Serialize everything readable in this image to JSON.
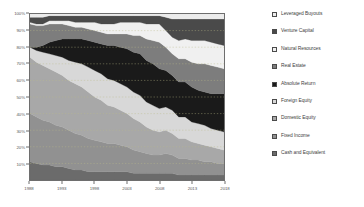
{
  "chart_data": {
    "type": "area",
    "title": "",
    "xlabel": "",
    "ylabel": "",
    "stacked": true,
    "stack_normalized": true,
    "grid": true,
    "grid_style": "dotted-horizontal",
    "legend_position": "right",
    "xlim": [
      1988,
      2018
    ],
    "ylim": [
      0,
      100
    ],
    "yticks": [
      "10%",
      "20%",
      "30%",
      "40%",
      "50%",
      "60%",
      "70%",
      "80%",
      "90%",
      "100%"
    ],
    "ytick_values": [
      10,
      20,
      30,
      40,
      50,
      60,
      70,
      80,
      90,
      100
    ],
    "xticks": [
      "1988",
      "1993",
      "1998",
      "2003",
      "2008",
      "2013",
      "2018"
    ],
    "xtick_values": [
      1988,
      1993,
      1998,
      2003,
      2008,
      2013,
      2018
    ],
    "x": [
      1988,
      1989,
      1990,
      1991,
      1992,
      1993,
      1994,
      1995,
      1996,
      1997,
      1998,
      1999,
      2000,
      2001,
      2002,
      2003,
      2004,
      2005,
      2006,
      2007,
      2008,
      2009,
      2010,
      2011,
      2012,
      2013,
      2014,
      2015,
      2016,
      2017,
      2018
    ],
    "series": [
      {
        "name": "Cash and Equivalent",
        "color": "#6b6b6b",
        "values": [
          11,
          10,
          9,
          9,
          8,
          8,
          7,
          6,
          6,
          5,
          5,
          5,
          5,
          5,
          5,
          5,
          4,
          4,
          4,
          4,
          4,
          4,
          4,
          3,
          3,
          3,
          3,
          3,
          3,
          3,
          3
        ]
      },
      {
        "name": "Fixed Income",
        "color": "#919191",
        "values": [
          29,
          28,
          27,
          26,
          25,
          24,
          23,
          22,
          21,
          20,
          19,
          18,
          17,
          17,
          16,
          15,
          14,
          13,
          12,
          11,
          11,
          12,
          11,
          10,
          10,
          9,
          9,
          8,
          8,
          7,
          7
        ]
      },
      {
        "name": "Domestic Equity",
        "color": "#a8a8a8",
        "values": [
          34,
          33,
          33,
          32,
          32,
          31,
          30,
          30,
          29,
          28,
          26,
          25,
          23,
          22,
          21,
          20,
          19,
          18,
          16,
          15,
          14,
          14,
          13,
          12,
          12,
          11,
          10,
          10,
          9,
          9,
          8
        ]
      },
      {
        "name": "Foreign Equity",
        "color": "#d8d8d8",
        "values": [
          6,
          7,
          8,
          9,
          10,
          11,
          12,
          13,
          14,
          15,
          16,
          16,
          16,
          16,
          16,
          16,
          16,
          16,
          15,
          15,
          14,
          14,
          14,
          13,
          13,
          12,
          12,
          12,
          11,
          11,
          11
        ]
      },
      {
        "name": "Absolute Return",
        "color": "#1a1a1a",
        "values": [
          0,
          2,
          4,
          7,
          9,
          11,
          13,
          14,
          15,
          16,
          17,
          18,
          20,
          21,
          22,
          23,
          24,
          25,
          25,
          25,
          24,
          22,
          21,
          21,
          21,
          21,
          20,
          20,
          21,
          22,
          23
        ]
      },
      {
        "name": "Real Estate",
        "color": "#7d7d7d",
        "values": [
          14,
          13,
          12,
          11,
          10,
          9,
          8,
          7,
          7,
          7,
          7,
          7,
          7,
          7,
          8,
          9,
          10,
          11,
          13,
          14,
          16,
          14,
          13,
          14,
          14,
          15,
          16,
          17,
          17,
          16,
          15
        ]
      },
      {
        "name": "Natural Resources",
        "color": "#f0f0f0",
        "values": [
          1,
          1,
          1,
          2,
          2,
          2,
          3,
          3,
          3,
          4,
          5,
          5,
          6,
          6,
          7,
          7,
          8,
          8,
          9,
          10,
          11,
          10,
          10,
          11,
          12,
          13,
          14,
          14,
          14,
          14,
          14
        ]
      },
      {
        "name": "Venture Capital",
        "color": "#4a4a4a",
        "values": [
          3,
          4,
          4,
          3,
          3,
          3,
          3,
          4,
          4,
          4,
          4,
          5,
          5,
          5,
          4,
          4,
          4,
          4,
          5,
          5,
          5,
          8,
          11,
          13,
          12,
          13,
          13,
          13,
          14,
          15,
          16
        ]
      },
      {
        "name": "Leveraged Buyouts",
        "color": "#ececec",
        "values": [
          2,
          2,
          2,
          1,
          1,
          1,
          1,
          1,
          1,
          1,
          1,
          1,
          1,
          1,
          1,
          1,
          1,
          1,
          1,
          1,
          1,
          2,
          3,
          3,
          3,
          3,
          3,
          3,
          3,
          3,
          3
        ]
      }
    ],
    "legend_order": [
      "Leveraged Buyouts",
      "Venture Capital",
      "Natural Resources",
      "Real Estate",
      "Absolute Return",
      "Foreign Equity",
      "Domestic Equity",
      "Fixed Income",
      "Cash and Equivalent"
    ]
  },
  "colors": {
    "plot_background": "#f2f2f2",
    "axis": "#6e6e6e",
    "tick_text": "#5a5a5a",
    "legend_text": "#3d3d3d",
    "gridline": "#bdbd8a"
  }
}
